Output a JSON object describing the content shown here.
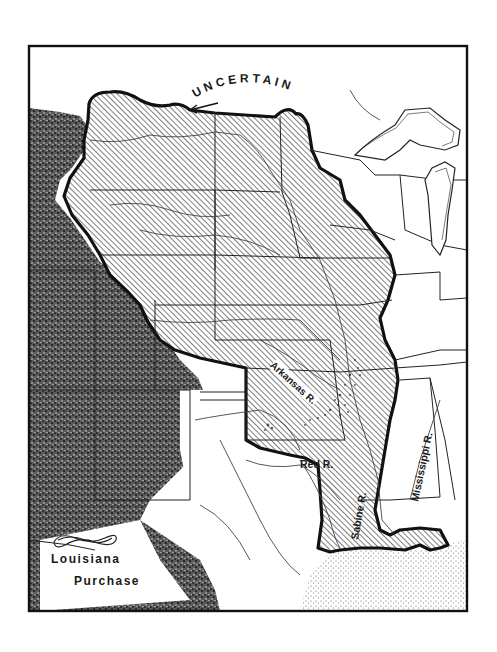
{
  "map": {
    "title": "Louisiana Purchase",
    "legend": {
      "line1": "Louisiana",
      "line2": "Purchase",
      "ornament": "decorative-scroll"
    },
    "annotations": {
      "uncertain": "UNCERTAIN"
    },
    "rivers": {
      "arkansas": "Arkansas R.",
      "red": "Red R.",
      "sabine": "Sabine R.",
      "mississippi": "Mississippi R."
    },
    "colors": {
      "ink": "#1a1a1a",
      "paper": "#ffffff",
      "hatch": "#3a3a3a",
      "terrain": "#2b2b2b"
    }
  }
}
